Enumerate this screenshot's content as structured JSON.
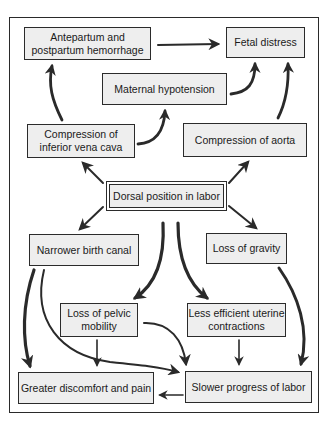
{
  "diagram": {
    "nodes": {
      "antepartum": "Antepartum and postpartum hemorrhage",
      "fetal_distress": "Fetal distress",
      "maternal_hypotension": "Maternal hypotension",
      "compression_ivc": "Compression of inferior vena cava",
      "compression_aorta": "Compression of aorta",
      "dorsal_position": "Dorsal position in labor",
      "narrower_canal": "Narrower birth canal",
      "loss_gravity": "Loss of gravity",
      "loss_pelvic": "Loss of pelvic mobility",
      "less_efficient": "Less efficient uterine contractions",
      "greater_discomfort": "Greater discomfort and pain",
      "slower_progress": "Slower progress of labor"
    },
    "edges": [
      {
        "from": "dorsal_position",
        "to": "compression_ivc"
      },
      {
        "from": "dorsal_position",
        "to": "compression_aorta"
      },
      {
        "from": "dorsal_position",
        "to": "narrower_canal"
      },
      {
        "from": "dorsal_position",
        "to": "loss_gravity"
      },
      {
        "from": "dorsal_position",
        "to": "loss_pelvic"
      },
      {
        "from": "dorsal_position",
        "to": "less_efficient"
      },
      {
        "from": "compression_ivc",
        "to": "antepartum"
      },
      {
        "from": "compression_ivc",
        "to": "maternal_hypotension"
      },
      {
        "from": "maternal_hypotension",
        "to": "fetal_distress"
      },
      {
        "from": "compression_aorta",
        "to": "fetal_distress"
      },
      {
        "from": "antepartum",
        "to": "fetal_distress"
      },
      {
        "from": "narrower_canal",
        "to": "greater_discomfort"
      },
      {
        "from": "narrower_canal",
        "to": "slower_progress"
      },
      {
        "from": "loss_pelvic",
        "to": "greater_discomfort"
      },
      {
        "from": "loss_pelvic",
        "to": "slower_progress"
      },
      {
        "from": "less_efficient",
        "to": "slower_progress"
      },
      {
        "from": "loss_gravity",
        "to": "slower_progress"
      },
      {
        "from": "slower_progress",
        "to": "greater_discomfort"
      }
    ],
    "colors": {
      "box_fill": "#eeeeee",
      "border": "#2b2b2b",
      "arrow": "#2a2a2a"
    }
  }
}
